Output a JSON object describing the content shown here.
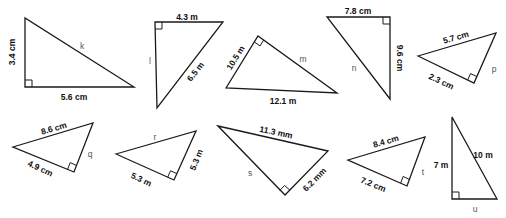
{
  "colors": {
    "background": "#ffffff",
    "stroke": "#1a1a1a",
    "label": "#111111",
    "unknown": "#555555"
  },
  "triangles": [
    {
      "id": "k",
      "points": [
        [
          25,
          18
        ],
        [
          25,
          87
        ],
        [
          134,
          87
        ]
      ],
      "right_angle": {
        "corner": [
          25,
          87
        ],
        "dir1": [
          0,
          -1
        ],
        "dir2": [
          1,
          0
        ]
      },
      "labels": {
        "a": {
          "text": "3.4 cm",
          "x": 13,
          "y": 52,
          "rot": -90
        },
        "b": {
          "text": "5.6 cm",
          "x": 74,
          "y": 98,
          "rot": 0
        },
        "unknown": {
          "text": "k",
          "x": 82,
          "y": 47,
          "rot": 0
        }
      }
    },
    {
      "id": "l",
      "points": [
        [
          155,
          22
        ],
        [
          223,
          22
        ],
        [
          157,
          108
        ]
      ],
      "right_angle": {
        "corner": [
          155,
          22
        ],
        "dir1": [
          1,
          0
        ],
        "dir2": [
          0,
          1
        ]
      },
      "labels": {
        "a": {
          "text": "4.3 m",
          "x": 187,
          "y": 18,
          "rot": 0
        },
        "b": {
          "text": "6.5 m",
          "x": 196,
          "y": 72,
          "rot": -52
        },
        "unknown": {
          "text": "l",
          "x": 150,
          "y": 62,
          "rot": 0
        }
      }
    },
    {
      "id": "m",
      "points": [
        [
          226,
          88
        ],
        [
          258,
          36
        ],
        [
          337,
          93
        ]
      ],
      "right_angle": {
        "corner": [
          258,
          36
        ],
        "dir1": [
          -0.52,
          0.85
        ],
        "dir2": [
          0.81,
          0.58
        ]
      },
      "labels": {
        "a": {
          "text": "10.5 m",
          "x": 236,
          "y": 58,
          "rot": -58
        },
        "b": {
          "text": "12.1 m",
          "x": 283,
          "y": 102,
          "rot": 0
        },
        "unknown": {
          "text": "m",
          "x": 303,
          "y": 60,
          "rot": 0
        }
      }
    },
    {
      "id": "n",
      "points": [
        [
          327,
          17
        ],
        [
          390,
          17
        ],
        [
          390,
          99
        ]
      ],
      "right_angle": {
        "corner": [
          390,
          17
        ],
        "dir1": [
          -1,
          0
        ],
        "dir2": [
          0,
          1
        ]
      },
      "labels": {
        "a": {
          "text": "7.8 cm",
          "x": 358,
          "y": 12,
          "rot": 0
        },
        "b": {
          "text": "9.6 cm",
          "x": 399,
          "y": 58,
          "rot": 90
        },
        "unknown": {
          "text": "n",
          "x": 354,
          "y": 69,
          "rot": 0
        }
      }
    },
    {
      "id": "p",
      "points": [
        [
          418,
          56
        ],
        [
          496,
          33
        ],
        [
          474,
          83
        ]
      ],
      "right_angle": {
        "corner": [
          474,
          83
        ],
        "dir1": [
          -0.9,
          -0.43
        ],
        "dir2": [
          0.4,
          -0.92
        ]
      },
      "labels": {
        "a": {
          "text": "5.7 cm",
          "x": 456,
          "y": 38,
          "rot": -16
        },
        "b": {
          "text": "2.3 cm",
          "x": 441,
          "y": 82,
          "rot": 25
        },
        "unknown": {
          "text": "p",
          "x": 494,
          "y": 70,
          "rot": 0
        }
      }
    },
    {
      "id": "q",
      "points": [
        [
          13,
          147
        ],
        [
          93,
          123
        ],
        [
          74,
          172
        ]
      ],
      "right_angle": {
        "corner": [
          74,
          172
        ],
        "dir1": [
          -0.9,
          -0.41
        ],
        "dir2": [
          0.36,
          -0.93
        ]
      },
      "labels": {
        "a": {
          "text": "8.6 cm",
          "x": 54,
          "y": 129,
          "rot": -16
        },
        "b": {
          "text": "4.9 cm",
          "x": 40,
          "y": 169,
          "rot": 25
        },
        "unknown": {
          "text": "q",
          "x": 90,
          "y": 155,
          "rot": 0
        }
      }
    },
    {
      "id": "r",
      "points": [
        [
          116,
          154
        ],
        [
          196,
          131
        ],
        [
          174,
          180
        ]
      ],
      "right_angle": {
        "corner": [
          174,
          180
        ],
        "dir1": [
          -0.9,
          -0.41
        ],
        "dir2": [
          0.41,
          -0.91
        ]
      },
      "labels": {
        "a": {
          "text": "5.3 m",
          "x": 197,
          "y": 160,
          "rot": -68
        },
        "b": {
          "text": "5.3 m",
          "x": 141,
          "y": 180,
          "rot": 25
        },
        "unknown": {
          "text": "r",
          "x": 155,
          "y": 138,
          "rot": 0
        }
      }
    },
    {
      "id": "s",
      "points": [
        [
          218,
          126
        ],
        [
          328,
          151
        ],
        [
          285,
          195
        ]
      ],
      "right_angle": {
        "corner": [
          285,
          195
        ],
        "dir1": [
          -0.77,
          -0.64
        ],
        "dir2": [
          0.7,
          -0.71
        ]
      },
      "labels": {
        "a": {
          "text": "11.3 mm",
          "x": 276,
          "y": 133,
          "rot": 12
        },
        "b": {
          "text": "6.2 mm",
          "x": 315,
          "y": 180,
          "rot": -45
        },
        "unknown": {
          "text": "s",
          "x": 250,
          "y": 174,
          "rot": 0
        }
      }
    },
    {
      "id": "t",
      "points": [
        [
          348,
          160
        ],
        [
          425,
          137
        ],
        [
          407,
          186
        ]
      ],
      "right_angle": {
        "corner": [
          407,
          186
        ],
        "dir1": [
          -0.9,
          -0.42
        ],
        "dir2": [
          0.35,
          -0.94
        ]
      },
      "labels": {
        "a": {
          "text": "8.4 cm",
          "x": 386,
          "y": 142,
          "rot": -16
        },
        "b": {
          "text": "7.2 cm",
          "x": 373,
          "y": 185,
          "rot": 22
        },
        "unknown": {
          "text": "t",
          "x": 423,
          "y": 173,
          "rot": 0
        }
      }
    },
    {
      "id": "u",
      "points": [
        [
          452,
          117
        ],
        [
          452,
          199
        ],
        [
          497,
          199
        ]
      ],
      "right_angle": {
        "corner": [
          452,
          199
        ],
        "dir1": [
          0,
          -1
        ],
        "dir2": [
          1,
          0
        ]
      },
      "labels": {
        "a": {
          "text": "7 m",
          "x": 441,
          "y": 166,
          "rot": 0
        },
        "b": {
          "text": "10 m",
          "x": 483,
          "y": 156,
          "rot": 0
        },
        "unknown": {
          "text": "u",
          "x": 475,
          "y": 210,
          "rot": 0
        }
      }
    }
  ]
}
